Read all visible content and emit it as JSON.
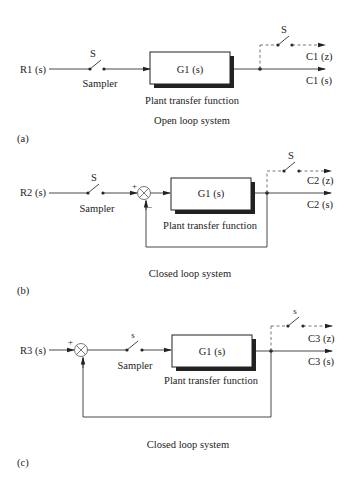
{
  "diagrams": [
    {
      "id": "a",
      "input": "R1 (s)",
      "sampler_switch": "S",
      "sampler_label": "Sampler",
      "block": "G1 (s)",
      "block_caption": "Plant transfer function",
      "output_switch": "S",
      "output_sampled": "C1 (z)",
      "output_continuous": "C1 (s)",
      "title": "Open loop system",
      "tag": "(a)"
    },
    {
      "id": "b",
      "input": "R2 (s)",
      "sampler_switch": "S",
      "sampler_label": "Sampler",
      "sum_plus": "+",
      "sum_minus": "−",
      "block": "G1 (s)",
      "block_caption": "Plant transfer function",
      "output_switch": "S",
      "output_sampled": "C2 (z)",
      "output_continuous": "C2 (s)",
      "title": "Closed loop system",
      "tag": "(b)"
    },
    {
      "id": "c",
      "input": "R3 (s)",
      "sum_plus": "+",
      "sampler_switch": "s",
      "sampler_label": "Sampler",
      "block": "G1 (s)",
      "block_caption": "Plant transfer function",
      "output_switch": "s",
      "output_sampled": "C3 (z)",
      "output_continuous": "C3 (s)",
      "title": "Closed loop system",
      "tag": "(c)"
    }
  ]
}
